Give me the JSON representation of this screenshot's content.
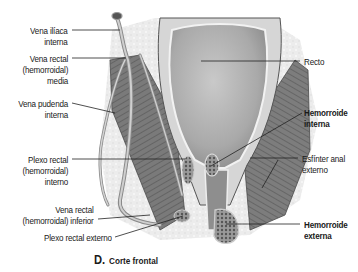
{
  "figure": {
    "caption_letter": "D.",
    "caption_text": "Corte frontal"
  },
  "labels_left": [
    {
      "id": "vena-iliaca-interna",
      "lines": [
        "Vena ilíaca",
        "interna"
      ]
    },
    {
      "id": "vena-rectal-media",
      "lines": [
        "Vena rectal",
        "(hemorroidal)",
        "media"
      ]
    },
    {
      "id": "vena-pudenda-interna",
      "lines": [
        "Vena pudenda",
        "interna"
      ]
    },
    {
      "id": "plexo-rectal-interno",
      "lines": [
        "Plexo rectal",
        "(hemorroidal)",
        "interno"
      ]
    },
    {
      "id": "vena-rectal-inferior",
      "lines": [
        "Vena rectal",
        "(hemorroidal) inferior"
      ]
    },
    {
      "id": "plexo-rectal-externo",
      "lines": [
        "Plexo rectal externo"
      ]
    }
  ],
  "labels_right": [
    {
      "id": "recto",
      "lines": [
        "Recto"
      ],
      "bold": false
    },
    {
      "id": "hemorroide-interna",
      "lines": [
        "Hemorroide",
        "interna"
      ],
      "bold": true
    },
    {
      "id": "esfinter-anal-externo",
      "lines": [
        "Esfínter anal",
        "externo"
      ],
      "bold": false
    },
    {
      "id": "hemorroide-externa",
      "lines": [
        "Hemorroide",
        "externa"
      ],
      "bold": true
    }
  ],
  "colors": {
    "label_text": "#1a1a1a",
    "leader_line": "#222222",
    "tissue_light": "#e9e9e9",
    "rectum_fill": "#b8b8b8",
    "muscle_dark": "#6e6e6e",
    "vein": "#8a8a8a"
  }
}
